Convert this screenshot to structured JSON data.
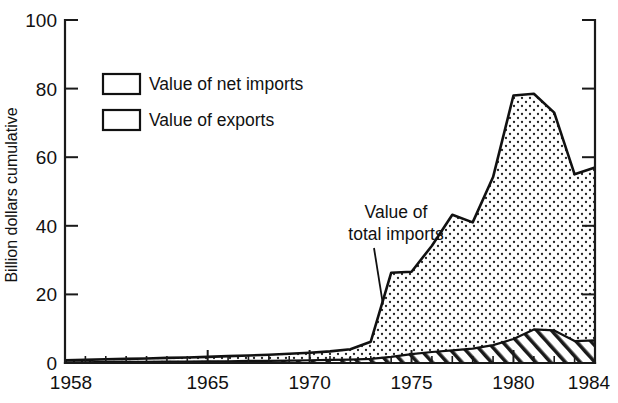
{
  "chart_data": {
    "type": "area",
    "title": "",
    "subtitle": "",
    "xlabel": "",
    "ylabel": "Billion dollars cumulative",
    "xlim": [
      1958,
      1984
    ],
    "ylim": [
      0,
      100
    ],
    "grid": false,
    "legend_position": "upper-left-inside",
    "x": [
      1958,
      1959,
      1960,
      1961,
      1962,
      1963,
      1964,
      1965,
      1966,
      1967,
      1968,
      1969,
      1970,
      1971,
      1972,
      1973,
      1974,
      1975,
      1976,
      1977,
      1978,
      1979,
      1980,
      1981,
      1982,
      1983,
      1984
    ],
    "xtick_labels": [
      "1958",
      "1965",
      "1970",
      "1975",
      "1980",
      "1984"
    ],
    "xtick_values": [
      1958,
      1965,
      1970,
      1975,
      1980,
      1984
    ],
    "ytick_labels": [
      "0",
      "20",
      "40",
      "60",
      "80",
      "100"
    ],
    "ytick_values": [
      0,
      20,
      40,
      60,
      80,
      100
    ],
    "series": [
      {
        "name": "Value of exports",
        "pattern": "diagonal-hatch",
        "values": [
          0.2,
          0.2,
          0.3,
          0.3,
          0.3,
          0.4,
          0.4,
          0.5,
          0.5,
          0.6,
          0.6,
          0.7,
          0.8,
          0.9,
          1.0,
          1.2,
          1.8,
          2.6,
          3.2,
          3.7,
          4.2,
          5.2,
          7.0,
          9.8,
          9.5,
          6.4,
          6.6
        ]
      },
      {
        "name": "Value of net imports",
        "pattern": "dotted",
        "values": [
          0.6,
          0.7,
          0.8,
          0.9,
          1.0,
          1.1,
          1.2,
          1.3,
          1.5,
          1.6,
          1.8,
          2.0,
          2.2,
          2.5,
          3.0,
          5.0,
          24.5,
          24.0,
          31.0,
          39.5,
          36.8,
          49.0,
          71.0,
          68.7,
          63.5,
          48.6,
          50.4
        ]
      }
    ],
    "total_imports_line": {
      "name": "Value of total imports",
      "values": [
        0.8,
        0.9,
        1.1,
        1.2,
        1.3,
        1.5,
        1.6,
        1.8,
        2.0,
        2.2,
        2.4,
        2.7,
        3.0,
        3.4,
        4.0,
        6.2,
        26.3,
        26.6,
        34.2,
        43.2,
        41.0,
        54.2,
        78.0,
        78.5,
        73.0,
        55.0,
        57.0
      ]
    },
    "annotations": [
      {
        "text_line1": "Value of",
        "text_line2": "total imports",
        "target_x": 1973.6,
        "target_y": 17.0
      }
    ]
  },
  "legend": {
    "items": [
      {
        "label": "Value of net imports",
        "swatch": "dotted-swatch"
      },
      {
        "label": "Value of exports",
        "swatch": "hatched-swatch"
      }
    ]
  },
  "axes": {
    "y_title": "Billion dollars cumulative"
  },
  "colors": {
    "ink": "#111111",
    "background": "#ffffff"
  }
}
